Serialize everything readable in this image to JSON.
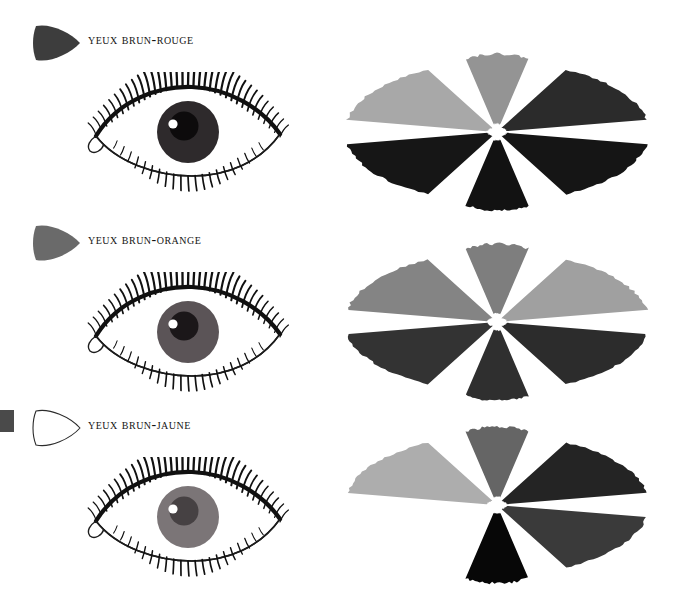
{
  "page": {
    "background": "#ffffff",
    "width": 680,
    "height": 600
  },
  "edge_marker": {
    "present_on_row": 3,
    "color": "#4a4a4a"
  },
  "rows": [
    {
      "label": "Yeux brun-rouge",
      "cone": {
        "name": "cone-marker-filled-dark",
        "fill": "#3d3d3d",
        "stroke": "#2b2b2b",
        "filled": true
      },
      "eye": {
        "name": "eye-illustration-brun-rouge",
        "iris": "#2e2a2c",
        "pupil": "#0d0b0c",
        "highlight": "#ffffff",
        "sclera": "#ffffff",
        "lash": "#111111"
      },
      "rosette": {
        "name": "rosette-brun-rouge",
        "petals": [
          {
            "position": "upper-left",
            "color": "#a8a8a8",
            "present": true
          },
          {
            "position": "upper-center",
            "color": "#949494",
            "present": true
          },
          {
            "position": "upper-right",
            "color": "#2b2b2b",
            "present": true
          },
          {
            "position": "lower-left",
            "color": "#161616",
            "present": true
          },
          {
            "position": "lower-center",
            "color": "#121212",
            "present": true
          },
          {
            "position": "lower-right",
            "color": "#151515",
            "present": true
          }
        ]
      }
    },
    {
      "label": "Yeux brun-orange",
      "cone": {
        "name": "cone-marker-filled-medium",
        "fill": "#6a6a6a",
        "stroke": "#4d4d4d",
        "filled": true
      },
      "eye": {
        "name": "eye-illustration-brun-orange",
        "iris": "#5b5457",
        "pupil": "#1b1719",
        "highlight": "#ffffff",
        "sclera": "#ffffff",
        "lash": "#111111"
      },
      "rosette": {
        "name": "rosette-brun-orange",
        "petals": [
          {
            "position": "upper-left",
            "color": "#848484",
            "present": true
          },
          {
            "position": "upper-center",
            "color": "#7e7e7e",
            "present": true
          },
          {
            "position": "upper-right",
            "color": "#a0a0a0",
            "present": true
          },
          {
            "position": "lower-left",
            "color": "#333333",
            "present": true
          },
          {
            "position": "lower-center",
            "color": "#2f2f2f",
            "present": true
          },
          {
            "position": "lower-right",
            "color": "#2c2c2c",
            "present": true
          }
        ]
      }
    },
    {
      "label": "Yeux brun-jaune",
      "cone": {
        "name": "cone-marker-outline-white",
        "fill": "#ffffff",
        "stroke": "#2b2b2b",
        "filled": false
      },
      "eye": {
        "name": "eye-illustration-brun-jaune",
        "iris": "#7b7577",
        "pupil": "#464143",
        "highlight": "#ffffff",
        "sclera": "#ffffff",
        "lash": "#111111"
      },
      "rosette": {
        "name": "rosette-brun-jaune",
        "petals": [
          {
            "position": "upper-left",
            "color": "#adadad",
            "present": true
          },
          {
            "position": "upper-center",
            "color": "#656565",
            "present": true
          },
          {
            "position": "upper-right",
            "color": "#242424",
            "present": true
          },
          {
            "position": "lower-left",
            "color": "#ffffff",
            "present": false
          },
          {
            "position": "lower-center",
            "color": "#070707",
            "present": true
          },
          {
            "position": "lower-right",
            "color": "#3a3a3a",
            "present": true
          }
        ]
      }
    }
  ]
}
